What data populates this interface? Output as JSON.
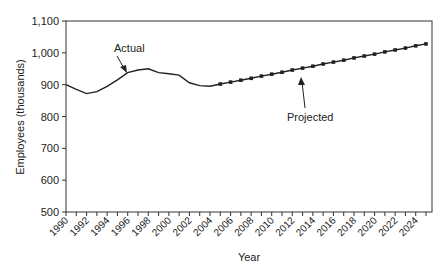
{
  "chart_data": {
    "type": "line",
    "title": "",
    "xlabel": "Year",
    "ylabel": "Employees (thousands)",
    "ylim": [
      500,
      1100
    ],
    "yticks": [
      500,
      600,
      700,
      800,
      900,
      1000,
      1100
    ],
    "ytick_labels": [
      "500",
      "600",
      "700",
      "800",
      "900",
      "1,000",
      "1,100"
    ],
    "xtick_labels": [
      "1990",
      "1992",
      "1994",
      "1996",
      "1998",
      "2000",
      "2002",
      "2004",
      "2006",
      "2008",
      "2010",
      "2012",
      "2014",
      "2016",
      "2018",
      "2020",
      "2022",
      "2024"
    ],
    "grid": false,
    "legend": "none (inline annotations)",
    "annotations": [
      {
        "text": "Actual",
        "points_to": "actual series ~1995"
      },
      {
        "text": "Projected",
        "points_to": "projected series ~2012"
      }
    ],
    "series": [
      {
        "name": "Actual",
        "marker": "none",
        "x": [
          1990,
          1991,
          1992,
          1993,
          1994,
          1995,
          1996,
          1997,
          1998,
          1999,
          2000,
          2001,
          2002,
          2003,
          2004
        ],
        "values": [
          900,
          885,
          872,
          878,
          895,
          915,
          938,
          946,
          950,
          938,
          934,
          930,
          906,
          897,
          895
        ]
      },
      {
        "name": "Projected",
        "marker": "square",
        "x": [
          2004,
          2005,
          2006,
          2007,
          2008,
          2009,
          2010,
          2011,
          2012,
          2013,
          2014,
          2015,
          2016,
          2017,
          2018,
          2019,
          2020,
          2021,
          2022,
          2023,
          2024,
          2025
        ],
        "values": [
          895,
          902,
          908,
          914,
          920,
          927,
          933,
          939,
          946,
          952,
          958,
          965,
          971,
          977,
          984,
          990,
          996,
          1003,
          1009,
          1015,
          1022,
          1028
        ]
      }
    ]
  },
  "labels": {
    "actual": "Actual",
    "projected": "Projected",
    "xlabel": "Year",
    "ylabel": "Employees (thousands)"
  }
}
